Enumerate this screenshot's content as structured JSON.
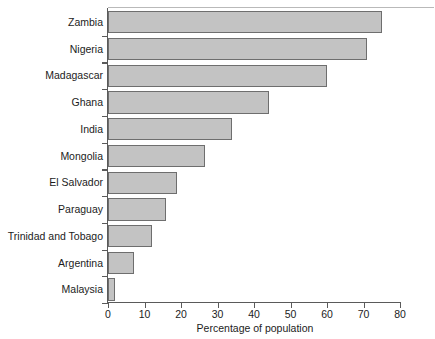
{
  "chart_data": {
    "type": "bar",
    "orientation": "horizontal",
    "title": "",
    "subtitle": "",
    "xlabel": "Percentage of population",
    "ylabel": "",
    "xlim": [
      0,
      80
    ],
    "xticks": [
      0,
      10,
      20,
      30,
      40,
      50,
      60,
      70,
      80
    ],
    "xticklabels": [
      "0",
      "10",
      "20",
      "30",
      "40",
      "50",
      "60",
      "70",
      "80"
    ],
    "grid": false,
    "legend": null,
    "categories": [
      "Zambia",
      "Nigeria",
      "Madagascar",
      "Ghana",
      "India",
      "Mongolia",
      "El Salvador",
      "Paraguay",
      "Trinidad and Tobago",
      "Argentina",
      "Malaysia"
    ],
    "values": [
      75,
      71,
      60,
      44,
      34,
      26.5,
      19,
      16,
      12,
      7,
      2
    ],
    "bar_fill": "#c3c3c3",
    "bar_edge": "#6e6e6e",
    "axis_color": "#5a5a5a"
  }
}
